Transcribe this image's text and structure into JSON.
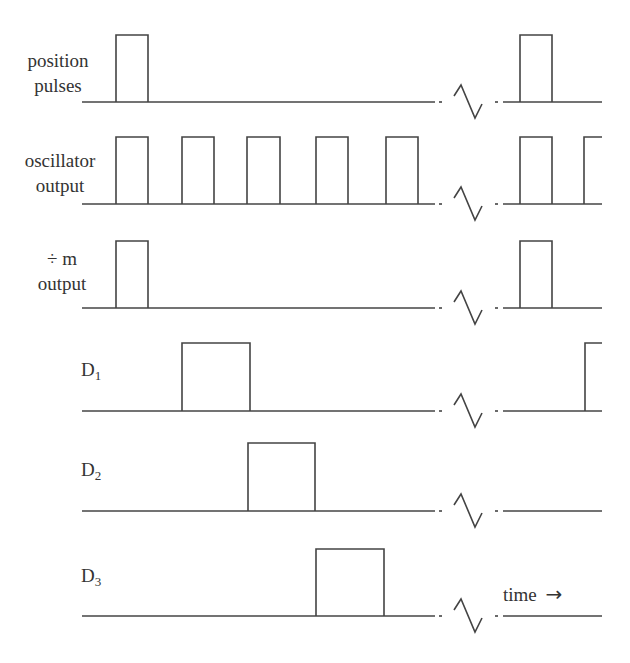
{
  "diagram": {
    "type": "timing-diagram",
    "stroke_color": "#444444",
    "rows": [
      {
        "id": "position-pulses",
        "label_lines": [
          "position",
          "pulses"
        ],
        "baseline_y": 102,
        "top_y": 35,
        "pulses_left": [
          [
            116,
            148
          ]
        ],
        "pulses_right": [
          [
            520,
            552
          ]
        ],
        "right_open_rise": null
      },
      {
        "id": "oscillator-output",
        "label_lines": [
          "oscillator",
          "output"
        ],
        "baseline_y": 204,
        "top_y": 137,
        "pulses_left": [
          [
            116,
            148
          ],
          [
            182,
            214
          ],
          [
            247,
            280
          ],
          [
            316,
            348
          ],
          [
            386,
            418
          ]
        ],
        "pulses_right": [
          [
            520,
            552
          ]
        ],
        "right_open_rise": 584
      },
      {
        "id": "divide-m-output",
        "label_lines": [
          "÷ m",
          "output"
        ],
        "baseline_y": 308,
        "top_y": 241,
        "pulses_left": [
          [
            116,
            148
          ]
        ],
        "pulses_right": [
          [
            520,
            552
          ]
        ],
        "right_open_rise": null
      },
      {
        "id": "d1",
        "label": "D",
        "subscript": "1",
        "baseline_y": 411,
        "top_y": 343,
        "pulses_left": [
          [
            182,
            250
          ]
        ],
        "pulses_right": [],
        "right_open_rise": 585
      },
      {
        "id": "d2",
        "label": "D",
        "subscript": "2",
        "baseline_y": 511,
        "top_y": 443,
        "pulses_left": [
          [
            248,
            315
          ]
        ],
        "pulses_right": [],
        "right_open_rise": null
      },
      {
        "id": "d3",
        "label": "D",
        "subscript": "3",
        "baseline_y": 616,
        "top_y": 549,
        "pulses_left": [
          [
            316,
            384
          ]
        ],
        "pulses_right": [],
        "right_open_rise": null
      }
    ],
    "axis": {
      "line_start_x": 82,
      "line_break_end_x": 435,
      "line_resume_x": 503,
      "line_end_x": 602
    },
    "time_label": "time",
    "time_arrow": "→"
  }
}
